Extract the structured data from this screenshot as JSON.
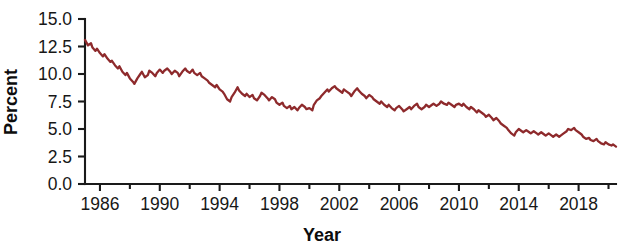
{
  "chart_data": {
    "type": "line",
    "title": "",
    "xlabel": "Year",
    "ylabel": "Percent",
    "xlim": [
      1985.0,
      2020.5
    ],
    "ylim": [
      0.0,
      15.0
    ],
    "grid": false,
    "legend": false,
    "line_color": "#8e2a2c",
    "axis_color": "#1a1a1a",
    "x_ticks": [
      1986,
      1990,
      1994,
      1998,
      2002,
      2006,
      2010,
      2014,
      2018
    ],
    "x_tick_labels": [
      "1986",
      "1990",
      "1994",
      "1998",
      "2002",
      "2006",
      "2010",
      "2014",
      "2018"
    ],
    "x_minor_tick_interval": 2,
    "y_ticks": [
      0.0,
      2.5,
      5.0,
      7.5,
      10.0,
      12.5,
      15.0
    ],
    "y_tick_labels": [
      "0.0",
      "2.5",
      "5.0",
      "7.5",
      "10.0",
      "12.5",
      "15.0"
    ],
    "series": [
      {
        "name": "Percent",
        "x": [
          1985.0,
          1985.2,
          1985.4,
          1985.5,
          1985.7,
          1985.8,
          1986.0,
          1986.2,
          1986.3,
          1986.5,
          1986.7,
          1986.8,
          1987.0,
          1987.2,
          1987.3,
          1987.5,
          1987.7,
          1987.8,
          1988.0,
          1988.2,
          1988.3,
          1988.5,
          1988.7,
          1988.8,
          1989.0,
          1989.2,
          1989.3,
          1989.5,
          1989.7,
          1989.8,
          1990.0,
          1990.2,
          1990.3,
          1990.5,
          1990.7,
          1990.8,
          1991.0,
          1991.2,
          1991.3,
          1991.5,
          1991.7,
          1991.8,
          1992.0,
          1992.2,
          1992.3,
          1992.5,
          1992.7,
          1992.8,
          1993.0,
          1993.2,
          1993.3,
          1993.5,
          1993.7,
          1993.8,
          1994.0,
          1994.2,
          1994.3,
          1994.5,
          1994.7,
          1994.8,
          1995.0,
          1995.2,
          1995.3,
          1995.5,
          1995.7,
          1995.8,
          1996.0,
          1996.2,
          1996.3,
          1996.5,
          1996.7,
          1996.8,
          1997.0,
          1997.2,
          1997.3,
          1997.5,
          1997.7,
          1997.8,
          1998.0,
          1998.2,
          1998.3,
          1998.5,
          1998.7,
          1998.8,
          1999.0,
          1999.2,
          1999.3,
          1999.5,
          1999.7,
          1999.8,
          2000.0,
          2000.2,
          2000.3,
          2000.5,
          2000.7,
          2000.8,
          2001.0,
          2001.2,
          2001.3,
          2001.5,
          2001.7,
          2001.8,
          2002.0,
          2002.2,
          2002.3,
          2002.5,
          2002.7,
          2002.8,
          2003.0,
          2003.2,
          2003.3,
          2003.5,
          2003.7,
          2003.8,
          2004.0,
          2004.2,
          2004.3,
          2004.5,
          2004.7,
          2004.8,
          2005.0,
          2005.2,
          2005.3,
          2005.5,
          2005.7,
          2005.8,
          2006.0,
          2006.2,
          2006.3,
          2006.5,
          2006.7,
          2006.8,
          2007.0,
          2007.2,
          2007.3,
          2007.5,
          2007.7,
          2007.8,
          2008.0,
          2008.2,
          2008.3,
          2008.5,
          2008.7,
          2008.8,
          2009.0,
          2009.2,
          2009.3,
          2009.5,
          2009.7,
          2009.8,
          2010.0,
          2010.2,
          2010.3,
          2010.5,
          2010.7,
          2010.8,
          2011.0,
          2011.2,
          2011.3,
          2011.5,
          2011.7,
          2011.8,
          2012.0,
          2012.2,
          2012.3,
          2012.5,
          2012.7,
          2012.8,
          2013.0,
          2013.2,
          2013.3,
          2013.5,
          2013.7,
          2013.8,
          2014.0,
          2014.2,
          2014.3,
          2014.5,
          2014.7,
          2014.8,
          2015.0,
          2015.2,
          2015.3,
          2015.5,
          2015.7,
          2015.8,
          2016.0,
          2016.2,
          2016.3,
          2016.5,
          2016.7,
          2016.8,
          2017.0,
          2017.2,
          2017.3,
          2017.5,
          2017.7,
          2017.8,
          2018.0,
          2018.2,
          2018.3,
          2018.5,
          2018.7,
          2018.8,
          2019.0,
          2019.2,
          2019.3,
          2019.5,
          2019.7,
          2019.8,
          2020.0,
          2020.2,
          2020.3,
          2020.5
        ],
        "y": [
          13.1,
          12.6,
          12.8,
          12.4,
          12.1,
          12.3,
          11.9,
          11.6,
          11.8,
          11.4,
          11.1,
          11.2,
          10.8,
          10.5,
          10.7,
          10.2,
          9.9,
          10.1,
          9.6,
          9.3,
          9.1,
          9.6,
          10.0,
          10.2,
          9.7,
          9.9,
          10.3,
          10.1,
          9.8,
          10.1,
          10.4,
          10.1,
          10.3,
          10.5,
          10.2,
          10.0,
          10.3,
          10.1,
          9.8,
          10.2,
          10.5,
          10.3,
          10.1,
          10.4,
          10.1,
          9.9,
          10.1,
          9.8,
          9.6,
          9.4,
          9.2,
          9.0,
          8.8,
          9.0,
          8.6,
          8.4,
          8.2,
          7.7,
          7.5,
          7.9,
          8.3,
          8.8,
          8.5,
          8.2,
          8.0,
          8.2,
          7.9,
          8.1,
          7.8,
          7.6,
          8.0,
          8.3,
          8.1,
          7.8,
          7.6,
          7.9,
          7.7,
          7.4,
          7.2,
          7.4,
          7.1,
          6.9,
          7.1,
          6.8,
          7.0,
          6.7,
          6.9,
          7.2,
          7.0,
          6.8,
          6.9,
          6.7,
          7.2,
          7.6,
          7.8,
          8.0,
          8.3,
          8.6,
          8.4,
          8.7,
          8.9,
          8.7,
          8.5,
          8.3,
          8.6,
          8.4,
          8.2,
          8.0,
          8.4,
          8.7,
          8.5,
          8.2,
          8.0,
          7.8,
          8.1,
          7.9,
          7.7,
          7.5,
          7.3,
          7.5,
          7.2,
          7.0,
          7.2,
          6.9,
          6.7,
          6.9,
          7.1,
          6.8,
          6.6,
          6.8,
          7.0,
          6.8,
          7.1,
          7.3,
          7.0,
          6.8,
          7.0,
          7.2,
          7.0,
          7.2,
          7.3,
          7.1,
          7.3,
          7.5,
          7.3,
          7.2,
          7.4,
          7.2,
          7.0,
          7.2,
          7.3,
          7.1,
          7.3,
          7.0,
          6.8,
          7.0,
          6.8,
          6.5,
          6.7,
          6.5,
          6.3,
          6.1,
          6.3,
          6.0,
          5.8,
          6.0,
          5.7,
          5.5,
          5.3,
          5.1,
          4.9,
          4.6,
          4.4,
          4.7,
          5.0,
          4.8,
          4.7,
          4.9,
          4.7,
          4.6,
          4.8,
          4.6,
          4.5,
          4.7,
          4.5,
          4.4,
          4.6,
          4.4,
          4.3,
          4.5,
          4.3,
          4.4,
          4.6,
          4.8,
          5.0,
          4.9,
          5.1,
          4.9,
          4.7,
          4.5,
          4.3,
          4.1,
          4.2,
          4.0,
          3.9,
          4.1,
          3.9,
          3.7,
          3.6,
          3.8,
          3.6,
          3.5,
          3.6,
          3.4
        ]
      }
    ]
  }
}
